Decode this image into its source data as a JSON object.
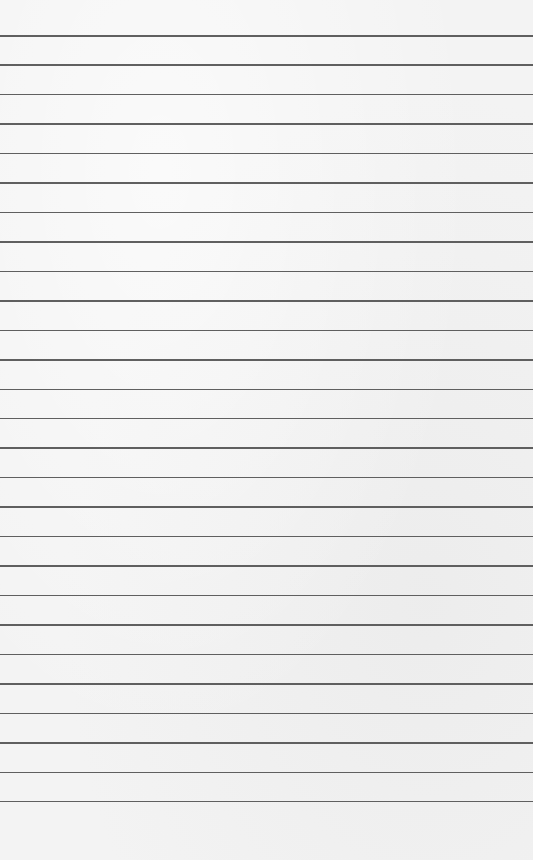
{
  "paper": {
    "type": "lined-paper",
    "background_color": "#f3f3f3",
    "line_color": "#4f4f4f",
    "line_count": 27,
    "first_line_y": 35,
    "line_spacing": 29.46
  }
}
